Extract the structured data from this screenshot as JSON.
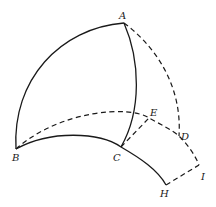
{
  "diagram": {
    "points": {
      "A": {
        "label": "A",
        "x": 124,
        "y": 23
      },
      "B": {
        "label": "B",
        "x": 16,
        "y": 149
      },
      "C": {
        "label": "C",
        "x": 121,
        "y": 147
      },
      "D": {
        "label": "D",
        "x": 179,
        "y": 136
      },
      "E": {
        "label": "E",
        "x": 149,
        "y": 118
      },
      "H": {
        "label": "H",
        "x": 166,
        "y": 185
      },
      "I": {
        "label": "I",
        "x": 199,
        "y": 165
      }
    },
    "solid_arcs": [
      "A-B",
      "A-C",
      "B-C-H"
    ],
    "dashed_arcs": [
      "A-D",
      "B-E-D-I",
      "C-E",
      "H-I"
    ],
    "colors": {
      "ink": "#1a1a1a",
      "background": "#ffffff"
    }
  }
}
